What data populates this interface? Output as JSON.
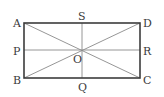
{
  "diagram": {
    "type": "rectangle-with-diagonals-and-midlines",
    "colors": {
      "rectangle": "#3c3c3c",
      "inner_lines": "#8a8a8a",
      "labels": "#3a3a3a"
    },
    "points": {
      "A": {
        "label": "A",
        "x": 24,
        "y": 23
      },
      "D": {
        "label": "D",
        "x": 140,
        "y": 23
      },
      "B": {
        "label": "B",
        "x": 24,
        "y": 78
      },
      "C": {
        "label": "C",
        "x": 140,
        "y": 78
      },
      "S": {
        "label": "S",
        "x": 82,
        "y": 23
      },
      "Q": {
        "label": "Q",
        "x": 82,
        "y": 78
      },
      "P": {
        "label": "P",
        "x": 24,
        "y": 50
      },
      "R": {
        "label": "R",
        "x": 140,
        "y": 50
      },
      "O": {
        "label": "O",
        "x": 82,
        "y": 50
      }
    },
    "segments": [
      "AD",
      "DC",
      "CB",
      "BA",
      "AC",
      "BD",
      "PR",
      "SQ"
    ]
  }
}
